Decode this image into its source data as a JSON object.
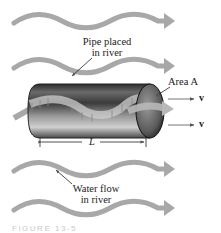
{
  "diagram": {
    "labels": {
      "pipe": [
        "Pipe placed",
        "in river"
      ],
      "area": "Area A",
      "length": "L",
      "water": [
        "Water flow",
        "in river"
      ],
      "velocity_top": "v",
      "velocity_bottom": "v"
    },
    "caption": "FIGURE 13-5",
    "colors": {
      "flow_arrow": "#a8a8a8",
      "pipe_dark": "#2a2a2a",
      "pipe_light": "#bdbdbd",
      "text": "#222222"
    }
  }
}
